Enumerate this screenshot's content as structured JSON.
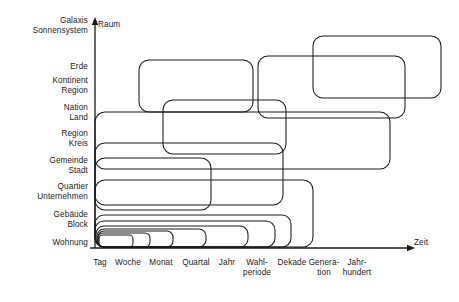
{
  "diagram": {
    "title_visible": false,
    "axes": {
      "y_axis_name": "Raum",
      "x_axis_name": "Zeit",
      "axis_color": "#1a1a1a"
    },
    "y_labels": [
      {
        "lines": [
          "Galaxis",
          "Sonnensystem"
        ],
        "y": 26
      },
      {
        "lines": [
          "Erde"
        ],
        "y": 67
      },
      {
        "lines": [
          "Kontinent",
          "Region"
        ],
        "y": 86
      },
      {
        "lines": [
          "Nation",
          "Land"
        ],
        "y": 113
      },
      {
        "lines": [
          "Region",
          "Kreis"
        ],
        "y": 139
      },
      {
        "lines": [
          "Gemeinde",
          "Stadt"
        ],
        "y": 166
      },
      {
        "lines": [
          "Quartier",
          "Unternehmen"
        ],
        "y": 192
      },
      {
        "lines": [
          "Gebäude",
          "Block"
        ],
        "y": 220
      },
      {
        "lines": [
          "Wohnung"
        ],
        "y": 243
      }
    ],
    "x_labels": [
      {
        "lines": [
          "Tag"
        ],
        "x": 100
      },
      {
        "lines": [
          "Woche"
        ],
        "x": 128
      },
      {
        "lines": [
          "Monat"
        ],
        "x": 161
      },
      {
        "lines": [
          "Quartal"
        ],
        "x": 196
      },
      {
        "lines": [
          "Jahr"
        ],
        "x": 227
      },
      {
        "lines": [
          "Wahl-",
          "periode"
        ],
        "x": 257
      },
      {
        "lines": [
          "Dekade"
        ],
        "x": 292
      },
      {
        "lines": [
          "Genera-",
          "tion"
        ],
        "x": 324
      },
      {
        "lines": [
          "Jahr-",
          "hundert"
        ],
        "x": 357
      }
    ],
    "boxes": [
      {
        "name": "box-galaxis-jahrhundert",
        "x": 313,
        "y": 36,
        "w": 128,
        "h": 62,
        "r": 10,
        "lw": 1.05
      },
      {
        "name": "box-erde-generation",
        "x": 258,
        "y": 56,
        "w": 147,
        "h": 62,
        "r": 10,
        "lw": 1.05
      },
      {
        "name": "box-erde-wahlperiode",
        "x": 139,
        "y": 60,
        "w": 114,
        "h": 52,
        "r": 10,
        "lw": 1.05
      },
      {
        "name": "box-nation-dekade",
        "x": 95,
        "y": 112,
        "w": 295,
        "h": 57,
        "r": 10,
        "lw": 1.05
      },
      {
        "name": "box-kontinent-generation",
        "x": 163,
        "y": 100,
        "w": 123,
        "h": 54,
        "r": 10,
        "lw": 1.05
      },
      {
        "name": "box-region-dekade2",
        "x": 95,
        "y": 143,
        "w": 188,
        "h": 62,
        "r": 10,
        "lw": 1.05
      },
      {
        "name": "box-gemeinde-wahl",
        "x": 95,
        "y": 158,
        "w": 116,
        "h": 52,
        "r": 10,
        "lw": 1.05
      },
      {
        "name": "box-quartier-dekade",
        "x": 95,
        "y": 180,
        "w": 218,
        "h": 67,
        "r": 10,
        "lw": 1.05
      },
      {
        "name": "box-gebaeude-generation",
        "x": 95,
        "y": 215,
        "w": 196,
        "h": 32,
        "r": 9,
        "lw": 1.05
      },
      {
        "name": "box-gebaeude-genera2",
        "x": 95,
        "y": 221,
        "w": 180,
        "h": 26,
        "r": 9,
        "lw": 1.05
      },
      {
        "name": "box-wohnung-wahl",
        "x": 96,
        "y": 226,
        "w": 152,
        "h": 21,
        "r": 8,
        "lw": 1.05
      },
      {
        "name": "box-wohnung-quartal",
        "x": 97,
        "y": 229,
        "w": 109,
        "h": 18,
        "r": 7,
        "lw": 1.05
      },
      {
        "name": "box-wohnung-monat",
        "x": 98,
        "y": 231,
        "w": 75,
        "h": 16,
        "r": 6,
        "lw": 1.05
      },
      {
        "name": "box-wohnung-woche",
        "x": 98,
        "y": 233,
        "w": 52,
        "h": 14,
        "r": 5,
        "lw": 1.05
      },
      {
        "name": "box-wohnung-tag",
        "x": 99,
        "y": 235,
        "w": 34,
        "h": 12,
        "r": 4,
        "lw": 1.05
      }
    ],
    "axis_geometry": {
      "origin_x": 95,
      "origin_y": 248,
      "y_top": 20,
      "x_right": 412
    }
  }
}
